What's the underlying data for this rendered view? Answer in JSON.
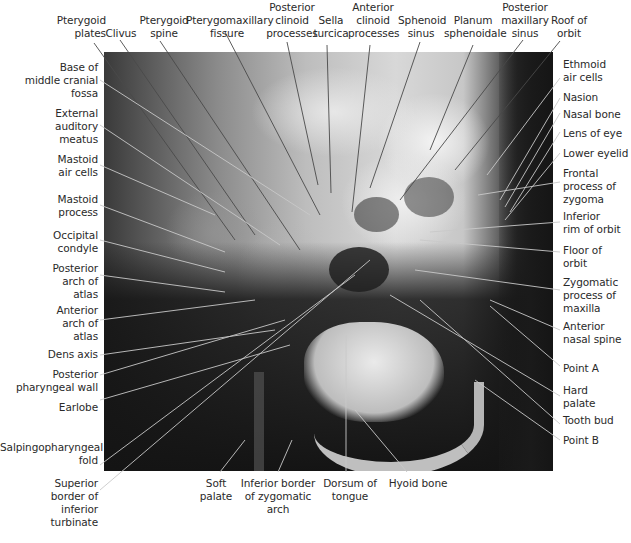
{
  "figure": {
    "type": "annotated lateral cephalometric radiograph",
    "colors": {
      "background": "#ffffff",
      "label_text": "#2a2a2a",
      "leader_on_light": "#555555",
      "leader_on_dark": "#d8d8d8"
    }
  },
  "labels": {
    "top": [
      {
        "text": "Pterygoid\nplates"
      },
      {
        "text": "Clivus"
      },
      {
        "text": "Pterygoid\nspine"
      },
      {
        "text": "Pterygomaxillary\nfissure"
      },
      {
        "text": "Posterior\nclinoid\nprocesses"
      },
      {
        "text": "Sella\nturcica"
      },
      {
        "text": "Anterior\nclinoid\nprocesses"
      },
      {
        "text": "Sphenoid\nsinus"
      },
      {
        "text": "Planum\nsphenoidale"
      },
      {
        "text": "Posterior\nmaxillary\nsinus"
      },
      {
        "text": "Roof of\norbit"
      }
    ],
    "left": [
      {
        "text": "Base of\nmiddle cranial\nfossa"
      },
      {
        "text": "External\nauditory\nmeatus"
      },
      {
        "text": "Mastoid\nair cells"
      },
      {
        "text": "Mastoid\nprocess"
      },
      {
        "text": "Occipital\ncondyle"
      },
      {
        "text": "Posterior\narch of\natlas"
      },
      {
        "text": "Anterior\narch of\natlas"
      },
      {
        "text": "Dens axis"
      },
      {
        "text": "Posterior\npharyngeal wall"
      },
      {
        "text": "Earlobe"
      },
      {
        "text": "Salpingopharyngeal\nfold"
      },
      {
        "text": "Superior\nborder of\ninferior\nturbinate"
      }
    ],
    "right": [
      {
        "text": "Ethmoid\nair cells"
      },
      {
        "text": "Nasion"
      },
      {
        "text": "Nasal bone"
      },
      {
        "text": "Lens of eye"
      },
      {
        "text": "Lower eyelid"
      },
      {
        "text": "Frontal\nprocess of\nzygoma"
      },
      {
        "text": "Inferior\nrim of orbit"
      },
      {
        "text": "Floor of\norbit"
      },
      {
        "text": "Zygomatic\nprocess of\nmaxilla"
      },
      {
        "text": "Anterior\nnasal spine"
      },
      {
        "text": "Point A"
      },
      {
        "text": "Hard\npalate"
      },
      {
        "text": "Tooth bud"
      },
      {
        "text": "Point B"
      }
    ],
    "bottom": [
      {
        "text": "Soft\npalate"
      },
      {
        "text": "Inferior border\nof zygomatic arch"
      },
      {
        "text": "Dorsum of\ntongue"
      },
      {
        "text": "Hyoid bone"
      }
    ]
  },
  "caption": {
    "text": ""
  }
}
